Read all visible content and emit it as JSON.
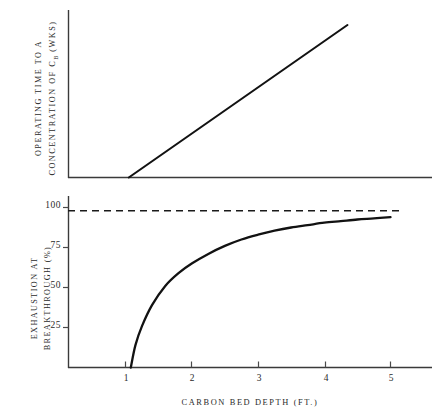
{
  "chart_data": [
    {
      "id": "upper-panel",
      "type": "line",
      "title": "",
      "ylabel_line1": "OPERATING TIME TO A",
      "ylabel_line2_pre": "CONCENTRATION OF C",
      "ylabel_line2_sub": "B",
      "ylabel_line2_post": " (WKS)",
      "xlabel": "",
      "x": [
        1.05,
        4.35
      ],
      "values": [
        0,
        100
      ],
      "xlim": [
        0.0,
        6.1
      ],
      "ylim": [
        0,
        112
      ],
      "xticks": [],
      "xtick_labels": [],
      "yticks": [],
      "ytick_labels": [],
      "grid": false,
      "legend": "none",
      "series": [
        {
          "name": "operating time to breakthrough concentration",
          "x": [
            1.05,
            4.35
          ],
          "values": [
            0,
            100
          ],
          "style": "solid-straight-line",
          "note": "linear increase beginning at critical bed depth"
        }
      ]
    },
    {
      "id": "lower-panel",
      "type": "line",
      "title": "",
      "ylabel_line1": "EXHAUSTION AT",
      "ylabel_line2": "BREAKTHROUGH (%)",
      "xlabel": "CARBON BED DEPTH (FT.)",
      "xlim": [
        0.0,
        6.1
      ],
      "ylim": [
        0,
        108
      ],
      "xticks": [
        1,
        2,
        3,
        4,
        5
      ],
      "xtick_labels": [
        "1",
        "2",
        "3",
        "4",
        "5"
      ],
      "yticks": [
        25,
        50,
        75,
        100
      ],
      "ytick_labels": [
        "25",
        "50",
        "75",
        "100"
      ],
      "grid": false,
      "legend": "none",
      "series": [
        {
          "name": "exhaustion at breakthrough",
          "style": "solid-curve",
          "x": [
            1.08,
            1.15,
            1.25,
            1.4,
            1.6,
            1.8,
            2.0,
            2.25,
            2.5,
            2.75,
            3.0,
            3.25,
            3.5,
            3.75,
            4.0,
            4.25,
            4.5,
            4.75,
            5.0
          ],
          "values": [
            0,
            14,
            26,
            39,
            51,
            59,
            65,
            71,
            76,
            80,
            83,
            85.5,
            87.5,
            89,
            90.5,
            91.5,
            92.5,
            93.2,
            94
          ],
          "note": "rises steeply from critical bed depth then approaches asymptote"
        },
        {
          "name": "theoretical maximum asymptote",
          "style": "dashed-horizontal",
          "value": 98,
          "x_start": 0.0,
          "x_end": 5.15,
          "note": "horizontal dashed line near 100 percent"
        }
      ]
    }
  ],
  "figure": {
    "background_color": "#ffffff",
    "line_color": "#121212",
    "axis_color": "#3a3a3a",
    "panels": [
      "upper-panel",
      "lower-panel"
    ]
  }
}
